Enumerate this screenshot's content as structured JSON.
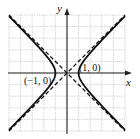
{
  "chart_data": {
    "type": "line",
    "title": "",
    "xlabel": "x",
    "ylabel": "y",
    "xlim": [
      -5,
      5
    ],
    "ylim": [
      -5,
      5
    ],
    "grid": true,
    "equation": "x^2 - y^2 = 1",
    "series": [
      {
        "name": "hyperbola",
        "style": "solid",
        "description": "x^2 - y^2 = 1"
      },
      {
        "name": "asymptote y = x",
        "style": "dashed",
        "points": [
          [
            -5,
            -5
          ],
          [
            5,
            5
          ]
        ]
      },
      {
        "name": "asymptote y = -x",
        "style": "dashed",
        "points": [
          [
            -5,
            5
          ],
          [
            5,
            -5
          ]
        ]
      }
    ],
    "annotations": [
      {
        "text": "(1, 0)",
        "x": 1,
        "y": 0
      },
      {
        "text": "(−1, 0)",
        "x": -1,
        "y": 0
      }
    ]
  },
  "labels": {
    "x_axis": "x",
    "y_axis": "y",
    "vertex_right": "(1, 0)",
    "vertex_left": "(−1, 0)"
  },
  "colors": {
    "curve": "#111111",
    "grid": "#b8b8b8",
    "axis": "#222222"
  }
}
